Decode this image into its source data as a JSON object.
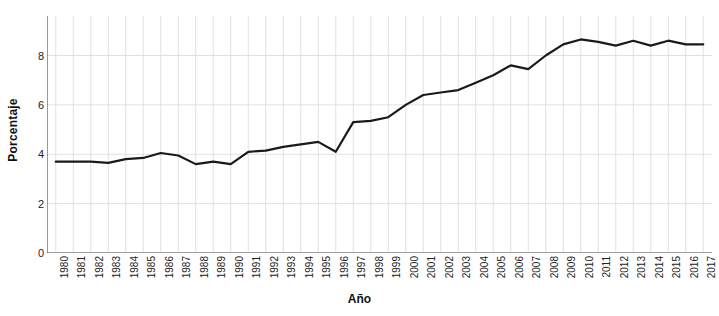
{
  "chart_data": {
    "type": "line",
    "title": "",
    "xlabel": "Año",
    "ylabel": "Porcentaje",
    "x": [
      1980,
      1981,
      1982,
      1983,
      1984,
      1985,
      1986,
      1987,
      1988,
      1989,
      1990,
      1991,
      1992,
      1993,
      1994,
      1995,
      1996,
      1997,
      1998,
      1999,
      2000,
      2001,
      2002,
      2003,
      2004,
      2005,
      2006,
      2007,
      2008,
      2009,
      2010,
      2011,
      2012,
      2013,
      2014,
      2015,
      2016,
      2017
    ],
    "categories": [
      "1980",
      "1981",
      "1982",
      "1983",
      "1984",
      "1985",
      "1986",
      "1987",
      "1988",
      "1989",
      "1990",
      "1991",
      "1992",
      "1993",
      "1994",
      "1995",
      "1996",
      "1997",
      "1998",
      "1999",
      "2000",
      "2001",
      "2002",
      "2003",
      "2004",
      "2005",
      "2006",
      "2007",
      "2008",
      "2009",
      "2010",
      "2011",
      "2012",
      "2013",
      "2014",
      "2015",
      "2016",
      "2017"
    ],
    "values": [
      3.7,
      3.7,
      3.7,
      3.65,
      3.8,
      3.85,
      4.05,
      3.95,
      3.6,
      3.7,
      3.6,
      4.1,
      4.15,
      4.3,
      4.4,
      4.5,
      4.1,
      5.3,
      5.35,
      5.5,
      6.0,
      6.4,
      6.5,
      6.6,
      6.9,
      7.2,
      7.6,
      7.45,
      8.0,
      8.45,
      8.65,
      8.55,
      8.4,
      8.6,
      8.4,
      8.6,
      8.45,
      8.45
    ],
    "xlim": [
      1979.5,
      2017.5
    ],
    "ylim": [
      0,
      9.6
    ],
    "yticks": [
      0,
      2,
      4,
      6,
      8
    ],
    "ytick_labels": [
      "0",
      "2",
      "4",
      "6",
      "8"
    ],
    "grid": true,
    "grid_axis": "both",
    "legend": false,
    "series_color": "#1a1a1a",
    "grid_color": "#d9d9d9",
    "axis_color": "#555555",
    "background": "#ffffff",
    "line_width": 2.2
  }
}
